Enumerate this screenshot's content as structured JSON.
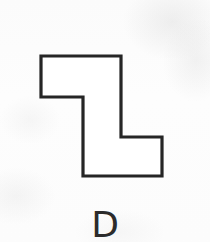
{
  "figure": {
    "label": "D",
    "label_font_size_px": 36,
    "label_top_px": 207,
    "background_color": "#fdfdfd",
    "stroke_color": "#252525",
    "stroke_width_px": 3.2,
    "fill_color": "#ffffff",
    "canvas": {
      "width": 210,
      "height": 242
    }
  },
  "shape": {
    "name": "stepped-z-polygon",
    "description": "Closed hexomino-like outline: a stepped Z / zig-zag block made of axis-aligned segments, drawn as a thin black outline on white.",
    "vertex_count": 8,
    "vertices": [
      {
        "x": 41,
        "y": 56
      },
      {
        "x": 121,
        "y": 56
      },
      {
        "x": 121,
        "y": 137
      },
      {
        "x": 162,
        "y": 137
      },
      {
        "x": 162,
        "y": 176
      },
      {
        "x": 83,
        "y": 176
      },
      {
        "x": 83,
        "y": 97
      },
      {
        "x": 41,
        "y": 97
      }
    ],
    "points_attr": "41,56 121,56 121,137 162,137 162,176 83,176 83,97 41,97",
    "bounding_box": {
      "x": 41,
      "y": 56,
      "width": 121,
      "height": 120
    },
    "segments": [
      {
        "name": "top-edge",
        "from": [
          41,
          56
        ],
        "to": [
          121,
          56
        ],
        "orientation": "horizontal",
        "length": 80
      },
      {
        "name": "upper-right-edge",
        "from": [
          121,
          56
        ],
        "to": [
          121,
          137
        ],
        "orientation": "vertical",
        "length": 81
      },
      {
        "name": "middle-right-step",
        "from": [
          121,
          137
        ],
        "to": [
          162,
          137
        ],
        "orientation": "horizontal",
        "length": 41
      },
      {
        "name": "far-right-edge",
        "from": [
          162,
          137
        ],
        "to": [
          162,
          176
        ],
        "orientation": "vertical",
        "length": 39
      },
      {
        "name": "bottom-edge",
        "from": [
          162,
          176
        ],
        "to": [
          83,
          176
        ],
        "orientation": "horizontal",
        "length": 79
      },
      {
        "name": "middle-left-edge",
        "from": [
          83,
          176
        ],
        "to": [
          83,
          97
        ],
        "orientation": "vertical",
        "length": 79
      },
      {
        "name": "upper-left-step",
        "from": [
          83,
          97
        ],
        "to": [
          41,
          97
        ],
        "orientation": "horizontal",
        "length": 42
      },
      {
        "name": "far-left-edge",
        "from": [
          41,
          97
        ],
        "to": [
          41,
          56
        ],
        "orientation": "vertical",
        "length": 41
      }
    ]
  }
}
